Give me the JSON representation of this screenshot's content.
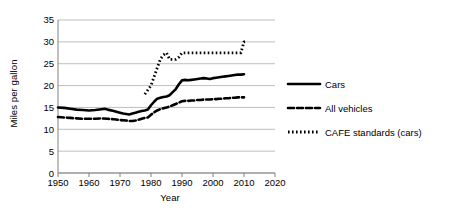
{
  "chart_data": {
    "type": "line",
    "title": "",
    "xlabel": "Year",
    "ylabel": "Miles per gallon",
    "xlim": [
      1950,
      2020
    ],
    "ylim": [
      0,
      35
    ],
    "xticks": [
      1950,
      1960,
      1970,
      1980,
      1990,
      2000,
      2010,
      2020
    ],
    "yticks": [
      0,
      5,
      10,
      15,
      20,
      25,
      30,
      35
    ],
    "grid": "horizontal",
    "legend_position": "right-outside",
    "series": [
      {
        "name": "Cars",
        "style": "solid",
        "color": "#000000",
        "x": [
          1950,
          1952,
          1954,
          1956,
          1958,
          1960,
          1962,
          1964,
          1965,
          1966,
          1968,
          1970,
          1971,
          1972,
          1973,
          1974,
          1975,
          1976,
          1977,
          1978,
          1979,
          1980,
          1981,
          1982,
          1983,
          1984,
          1985,
          1986,
          1987,
          1988,
          1989,
          1990,
          1991,
          1992,
          1993,
          1994,
          1995,
          1996,
          1997,
          1998,
          1999,
          2000,
          2001,
          2002,
          2003,
          2004,
          2005,
          2006,
          2007,
          2008,
          2009,
          2010
        ],
        "values": [
          15.0,
          14.9,
          14.7,
          14.5,
          14.4,
          14.3,
          14.4,
          14.6,
          14.7,
          14.5,
          14.2,
          13.8,
          13.6,
          13.5,
          13.4,
          13.6,
          13.8,
          14.0,
          14.2,
          14.3,
          14.5,
          15.5,
          16.3,
          17.0,
          17.2,
          17.4,
          17.5,
          17.8,
          18.5,
          19.2,
          20.3,
          21.2,
          21.3,
          21.2,
          21.3,
          21.4,
          21.5,
          21.6,
          21.7,
          21.6,
          21.5,
          21.7,
          21.8,
          21.9,
          22.0,
          22.1,
          22.2,
          22.3,
          22.4,
          22.5,
          22.5,
          22.6
        ]
      },
      {
        "name": "All vehicles",
        "style": "dashed",
        "color": "#000000",
        "x": [
          1950,
          1952,
          1954,
          1956,
          1958,
          1960,
          1962,
          1964,
          1966,
          1968,
          1970,
          1972,
          1973,
          1974,
          1975,
          1976,
          1977,
          1978,
          1979,
          1980,
          1981,
          1982,
          1983,
          1984,
          1985,
          1986,
          1987,
          1988,
          1989,
          1990,
          1991,
          1992,
          1993,
          1994,
          1995,
          1996,
          1997,
          1998,
          1999,
          2000,
          2001,
          2002,
          2003,
          2004,
          2005,
          2006,
          2007,
          2008,
          2009,
          2010
        ],
        "values": [
          12.8,
          12.7,
          12.6,
          12.5,
          12.4,
          12.4,
          12.4,
          12.5,
          12.4,
          12.3,
          12.1,
          12.0,
          11.9,
          11.9,
          12.0,
          12.2,
          12.4,
          12.6,
          12.7,
          13.3,
          13.9,
          14.3,
          14.6,
          14.8,
          15.0,
          15.2,
          15.5,
          15.8,
          16.1,
          16.4,
          16.5,
          16.5,
          16.6,
          16.6,
          16.7,
          16.7,
          16.8,
          16.8,
          16.8,
          16.9,
          16.9,
          17.0,
          17.0,
          17.1,
          17.1,
          17.2,
          17.2,
          17.3,
          17.3,
          17.3
        ]
      },
      {
        "name": "CAFE standards (cars)",
        "style": "dotted",
        "color": "#000000",
        "x": [
          1978,
          1979,
          1980,
          1981,
          1982,
          1983,
          1984,
          1985,
          1986,
          1987,
          1988,
          1989,
          1990,
          1991,
          1992,
          1993,
          1994,
          1995,
          1996,
          1997,
          1998,
          1999,
          2000,
          2001,
          2002,
          2003,
          2004,
          2005,
          2006,
          2007,
          2008,
          2009,
          2010,
          2011
        ],
        "values": [
          18.0,
          19.0,
          20.0,
          22.0,
          24.0,
          26.0,
          27.0,
          27.5,
          26.0,
          26.0,
          26.0,
          26.5,
          27.5,
          27.5,
          27.5,
          27.5,
          27.5,
          27.5,
          27.5,
          27.5,
          27.5,
          27.5,
          27.5,
          27.5,
          27.5,
          27.5,
          27.5,
          27.5,
          27.5,
          27.5,
          27.5,
          27.5,
          30.0,
          30.0
        ]
      }
    ]
  },
  "legend": {
    "items": [
      {
        "label": "Cars",
        "style": "solid"
      },
      {
        "label": "All vehicles",
        "style": "dashed"
      },
      {
        "label": "CAFE standards (cars)",
        "style": "dotted"
      }
    ]
  },
  "axes": {
    "y_label": "Miles per gallon",
    "x_label": "Year",
    "y_tick_labels": [
      "35",
      "30",
      "25",
      "20",
      "15",
      "10",
      "5",
      "0"
    ],
    "x_tick_labels": [
      "1950",
      "1960",
      "1970",
      "1980",
      "1990",
      "2000",
      "2010",
      "2020"
    ]
  },
  "colors": {
    "line": "#000000",
    "grid": "#bfbfbf",
    "axis": "#808080",
    "background": "#ffffff"
  }
}
